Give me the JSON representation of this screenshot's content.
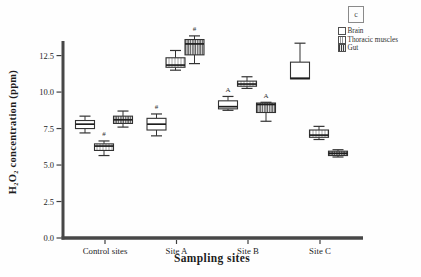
{
  "figure": {
    "background": "#fefefe",
    "axis_color": "#474747",
    "box_stroke_color": "#333333",
    "text_color": "#1d1d1d"
  },
  "chart_data": {
    "type": "boxplot",
    "title": "",
    "xlabel": "Sampling sites",
    "ylabel": "H₂O₂ concentration (ppm)",
    "ylim": [
      0,
      13.5
    ],
    "y_ticks": [
      0.0,
      2.5,
      5.0,
      7.5,
      10.0,
      12.5
    ],
    "y_tick_labels": [
      "0.0",
      "2.5",
      "5.0",
      "7.5",
      "10.0",
      "12.5"
    ],
    "categories": [
      "Control sites",
      "Site A",
      "Site B",
      "Site C"
    ],
    "grid": false,
    "legend": {
      "position": "top-right",
      "panel_letter": "c"
    },
    "series": [
      {
        "name": "Brain",
        "fill": "solid-white",
        "boxes": [
          {
            "whisker_low": 7.2,
            "q1": 7.5,
            "median": 7.8,
            "q3": 8.05,
            "whisker_high": 8.35,
            "annotation": null
          },
          {
            "whisker_low": 7.0,
            "q1": 7.4,
            "median": 7.8,
            "q3": 8.2,
            "whisker_high": 8.5,
            "annotation": "#"
          },
          {
            "whisker_low": 8.75,
            "q1": 8.85,
            "median": 9.0,
            "q3": 9.4,
            "whisker_high": 9.7,
            "annotation": "A"
          },
          {
            "whisker_low": 10.9,
            "q1": 10.9,
            "median": 10.95,
            "q3": 12.05,
            "whisker_high": 13.35,
            "annotation": null
          }
        ]
      },
      {
        "name": "Thoracic muscles",
        "fill": "stripes-light",
        "boxes": [
          {
            "whisker_low": 5.65,
            "q1": 6.0,
            "median": 6.3,
            "q3": 6.45,
            "whisker_high": 6.65,
            "annotation": "#"
          },
          {
            "whisker_low": 11.5,
            "q1": 11.7,
            "median": 11.85,
            "q3": 12.35,
            "whisker_high": 12.85,
            "annotation": null
          },
          {
            "whisker_low": 10.25,
            "q1": 10.4,
            "median": 10.55,
            "q3": 10.75,
            "whisker_high": 11.05,
            "annotation": null
          },
          {
            "whisker_low": 6.75,
            "q1": 6.9,
            "median": 7.05,
            "q3": 7.4,
            "whisker_high": 7.65,
            "annotation": null
          }
        ]
      },
      {
        "name": "Gut",
        "fill": "stripes-dense",
        "boxes": [
          {
            "whisker_low": 7.6,
            "q1": 7.85,
            "median": 8.1,
            "q3": 8.35,
            "whisker_high": 8.7,
            "annotation": null
          },
          {
            "whisker_low": 11.95,
            "q1": 12.55,
            "median": 13.3,
            "q3": 13.6,
            "whisker_high": 13.85,
            "annotation": "#"
          },
          {
            "whisker_low": 8.0,
            "q1": 8.6,
            "median": 9.15,
            "q3": 9.25,
            "whisker_high": 9.3,
            "annotation": "A"
          },
          {
            "whisker_low": 5.55,
            "q1": 5.65,
            "median": 5.8,
            "q3": 5.95,
            "whisker_high": 6.05,
            "annotation": null
          }
        ]
      }
    ]
  }
}
